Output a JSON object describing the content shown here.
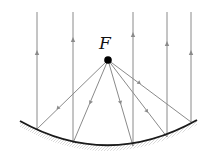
{
  "diagram": {
    "focus_label": "F",
    "focus": {
      "x": 108,
      "y": 60
    },
    "ray_color": "#8a8a8a",
    "mirror_color": "#1a1a1a",
    "rays": [
      {
        "x": 37,
        "y_mirror": 129
      },
      {
        "x": 73,
        "y_mirror": 143
      },
      {
        "x": 133,
        "y_mirror": 146
      },
      {
        "x": 167,
        "y_mirror": 137
      },
      {
        "x": 191,
        "y_mirror": 122
      }
    ]
  }
}
